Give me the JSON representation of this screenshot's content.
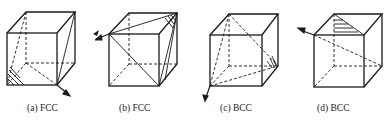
{
  "figure": {
    "panels": [
      {
        "id": "a",
        "caption": "(a) FCC",
        "structure": "FCC"
      },
      {
        "id": "b",
        "caption": "(b) FCC",
        "structure": "FCC"
      },
      {
        "id": "c",
        "caption": "(c) BCC",
        "structure": "BCC"
      },
      {
        "id": "d",
        "caption": "(d) BCC",
        "structure": "BCC"
      }
    ],
    "colors": {
      "line": "#1a1a1a",
      "background": "#ffffff"
    }
  }
}
